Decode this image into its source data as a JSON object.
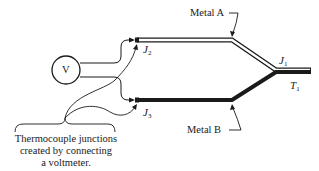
{
  "diagram": {
    "voltmeter": {
      "symbol": "V"
    },
    "metals": [
      {
        "name": "Metal A",
        "style": "double-line (hollow)"
      },
      {
        "name": "Metal B",
        "style": "thick solid line"
      }
    ],
    "junctions": [
      {
        "id": "J1",
        "letter": "J",
        "sub": "1"
      },
      {
        "id": "J2",
        "letter": "J",
        "sub": "2"
      },
      {
        "id": "J3",
        "letter": "J",
        "sub": "3"
      }
    ],
    "temperature": {
      "letter": "T",
      "sub": "1"
    },
    "caption": {
      "line1": "Thermocouple junctions",
      "line2": "created by connecting",
      "line3": "a voltmeter."
    },
    "colors": {
      "stroke": "#1a1a1a",
      "background": "#ffffff"
    }
  }
}
